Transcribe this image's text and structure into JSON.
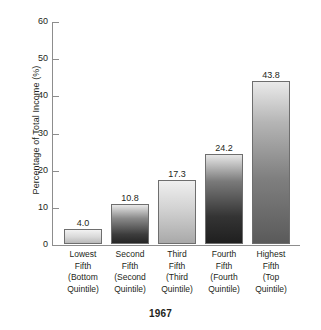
{
  "chart_data": {
    "type": "bar",
    "title": "1967",
    "xlabel": "",
    "ylabel": "Percentage of Total Income (%)",
    "ylim": [
      0,
      60
    ],
    "yticks": [
      0,
      10,
      20,
      30,
      40,
      50,
      60
    ],
    "grid": false,
    "legend": "none",
    "categories": [
      "Lowest Fifth (Bottom Quintile)",
      "Second Fifth (Second Quintile)",
      "Third Fifth (Third Quintile)",
      "Fourth Fifth (Fourth Quintile)",
      "Highest Fifth (Top Quintile)"
    ],
    "category_lines": [
      [
        "Lowest",
        "Fifth",
        "(Bottom",
        "Quintile)"
      ],
      [
        "Second",
        "Fifth",
        "(Second",
        "Quintile)"
      ],
      [
        "Third",
        "Fifth",
        "(Third",
        "Quintile)"
      ],
      [
        "Fourth",
        "Fifth",
        "(Fourth",
        "Quintile)"
      ],
      [
        "Highest",
        "Fifth",
        "(Top",
        "Quintile)"
      ]
    ],
    "values": [
      4.0,
      10.8,
      17.3,
      24.2,
      43.8
    ],
    "value_labels": [
      "4.0",
      "10.8",
      "17.3",
      "24.2",
      "43.8"
    ],
    "bar_fills": [
      "light-gray",
      "dark-gradient",
      "light-gray",
      "dark-gradient",
      "medium-gradient"
    ]
  },
  "axis": {
    "tick_labels": [
      "60",
      "50",
      "40",
      "30",
      "20",
      "10",
      "0"
    ]
  },
  "colors": {
    "text": "#231f20",
    "axis": "#8d8d8d",
    "bar_outline": "#6e6e6e",
    "background": "#ffffff"
  }
}
